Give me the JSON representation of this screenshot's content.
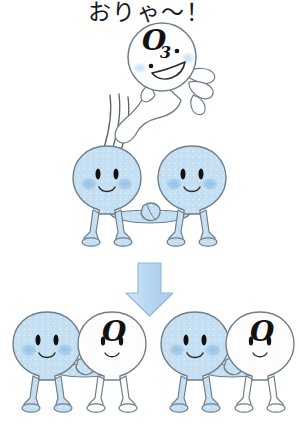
{
  "illustration": {
    "title_text": "おりゃ〜！",
    "background_color": "#ffffff",
    "outline_color": "#6f7f8c",
    "blue_body_color": "#c5dff2",
    "blue_body_shade": "#b3d4ee",
    "cheek_color": "#9fc8e8",
    "white_body_color": "#fdfdfd",
    "eye_color": "#111111",
    "arrow_fill": "#bcd9f2",
    "arrow_outline": "#8fb8dc",
    "text_color": "#1a1a1a"
  },
  "top_scene": {
    "caption": "おりゃ〜！",
    "flying_character": {
      "label_main": "O",
      "label_sub": "3",
      "body_color_name": "white",
      "expression": "big-smile"
    },
    "pair": [
      {
        "label": "",
        "body_color_name": "blue",
        "expression": "smile"
      },
      {
        "label": "",
        "body_color_name": "blue",
        "expression": "smile"
      }
    ]
  },
  "transition": {
    "arrow_direction": "down"
  },
  "bottom_scene": {
    "pairs": [
      {
        "left": {
          "label": "",
          "body_color_name": "blue",
          "expression": "smile"
        },
        "right": {
          "label": "O",
          "body_color_name": "white",
          "expression": "smile"
        }
      },
      {
        "left": {
          "label": "",
          "body_color_name": "blue",
          "expression": "smile"
        },
        "right": {
          "label": "O",
          "body_color_name": "white",
          "expression": "smile"
        }
      }
    ]
  }
}
